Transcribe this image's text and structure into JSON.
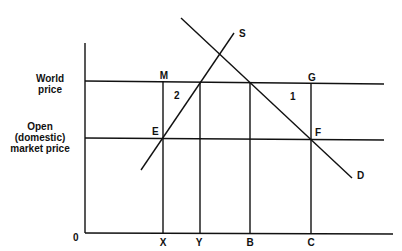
{
  "diagram": {
    "title": "",
    "y_axis_labels": {
      "world_price": [
        "World",
        "price"
      ],
      "domestic_price": [
        "Open",
        "(domestic)",
        "market price"
      ]
    },
    "origin_label": "0",
    "x_axis_labels": [
      "X",
      "Y",
      "B",
      "C"
    ],
    "curve_labels": {
      "supply": "S",
      "demand": "D"
    },
    "point_labels": {
      "M": "M",
      "G": "G",
      "E": "E",
      "F": "F"
    },
    "area_labels": {
      "area1": "1",
      "area2": "2"
    },
    "colors": {
      "line": "#111111",
      "background": "#ffffff"
    }
  }
}
